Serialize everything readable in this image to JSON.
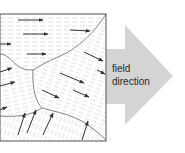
{
  "diagram": {
    "arrow_label_line1": "field",
    "arrow_label_line2": "direction",
    "colors": {
      "line": "#555555",
      "arrow_fill": "#d4d4d4",
      "hatch": "#bdbdbd",
      "background": "#ffffff"
    },
    "domains": [
      {
        "name": "top-domain",
        "arrow_direction": "right"
      },
      {
        "name": "right-domain",
        "arrow_direction": "down-right"
      },
      {
        "name": "left-domain",
        "arrow_direction": "up-right"
      },
      {
        "name": "bottom-domain",
        "arrow_direction": "up"
      }
    ]
  }
}
